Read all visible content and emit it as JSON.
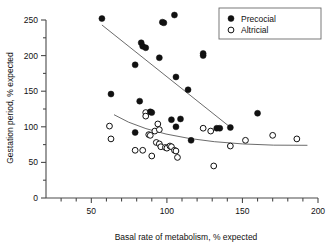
{
  "chart_data": {
    "type": "scatter",
    "title": "",
    "xlabel": "Basal rate of metabolism, % expected",
    "ylabel": "Gestation period, % expected",
    "xlim": [
      20,
      200
    ],
    "ylim": [
      0,
      260
    ],
    "x_ticks_major": [
      50,
      100,
      150,
      200
    ],
    "x_ticks_minor": [
      30,
      40,
      60,
      70,
      80,
      90,
      110,
      120,
      130,
      140,
      160,
      170,
      180,
      190
    ],
    "y_ticks_major": [
      0,
      50,
      100,
      150,
      200,
      250
    ],
    "y_ticks_minor": [
      25,
      75,
      125,
      175,
      225
    ],
    "x_tick_labels": [
      "50",
      "100",
      "150",
      "200"
    ],
    "y_tick_labels": [
      "0",
      "50",
      "100",
      "150",
      "200",
      "250"
    ],
    "grid": false,
    "legend_position": "top-right",
    "series": [
      {
        "name": "Precocial",
        "marker": "filled-circle",
        "color": "#111111",
        "points": [
          [
            57,
            252
          ],
          [
            79,
            187
          ],
          [
            63,
            146
          ],
          [
            83,
            218
          ],
          [
            84,
            213
          ],
          [
            86,
            211
          ],
          [
            97,
            247
          ],
          [
            98,
            246
          ],
          [
            105,
            257
          ],
          [
            95,
            197
          ],
          [
            106,
            170
          ],
          [
            114,
            152
          ],
          [
            124,
            203
          ],
          [
            124,
            200
          ],
          [
            82,
            136
          ],
          [
            89,
            121
          ],
          [
            90,
            120
          ],
          [
            79,
            92
          ],
          [
            103,
            110
          ],
          [
            109,
            111
          ],
          [
            106,
            100
          ],
          [
            116,
            81
          ],
          [
            133,
            98
          ],
          [
            135,
            98
          ],
          [
            142,
            99
          ],
          [
            160,
            119
          ]
        ]
      },
      {
        "name": "Altricial",
        "marker": "open-circle",
        "color": "#111111",
        "points": [
          [
            62,
            101
          ],
          [
            63,
            83
          ],
          [
            79,
            67
          ],
          [
            86,
            120
          ],
          [
            86,
            115
          ],
          [
            88,
            89
          ],
          [
            89,
            88
          ],
          [
            92,
            94
          ],
          [
            94,
            104
          ],
          [
            95,
            96
          ],
          [
            90,
            59
          ],
          [
            84,
            67
          ],
          [
            93,
            78
          ],
          [
            95,
            76
          ],
          [
            96,
            72
          ],
          [
            99,
            71
          ],
          [
            100,
            70
          ],
          [
            102,
            73
          ],
          [
            103,
            72
          ],
          [
            105,
            67
          ],
          [
            106,
            66
          ],
          [
            107,
            57
          ],
          [
            124,
            98
          ],
          [
            129,
            94
          ],
          [
            131,
            45
          ],
          [
            142,
            73
          ],
          [
            152,
            81
          ],
          [
            170,
            88
          ],
          [
            186,
            83
          ]
        ]
      }
    ],
    "fit_lines": [
      {
        "series": "Precocial",
        "type": "linear",
        "x_start": 57,
        "y_start": 243,
        "x_end": 141,
        "y_end": 101
      },
      {
        "series": "Altricial",
        "type": "curve",
        "x_start": 65,
        "y_start": 117,
        "x_end": 193,
        "y_end": 74,
        "control_x": 100,
        "control_y": 72
      }
    ]
  },
  "legend": {
    "items": [
      {
        "label": "Precocial",
        "marker": "filled-circle"
      },
      {
        "label": "Altricial",
        "marker": "open-circle"
      }
    ]
  }
}
